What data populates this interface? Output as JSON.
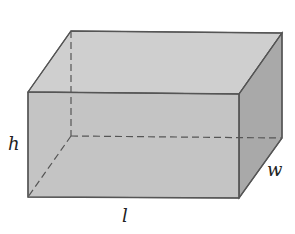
{
  "diagram": {
    "labels": {
      "height": "h",
      "width": "w",
      "length": "l"
    },
    "colors": {
      "front_face": "#c6c6c6",
      "top_face": "#cfcfcf",
      "side_face": "#a8a8a8",
      "edge": "#555555",
      "hidden_edge": "#555555",
      "background": "#ffffff"
    }
  }
}
